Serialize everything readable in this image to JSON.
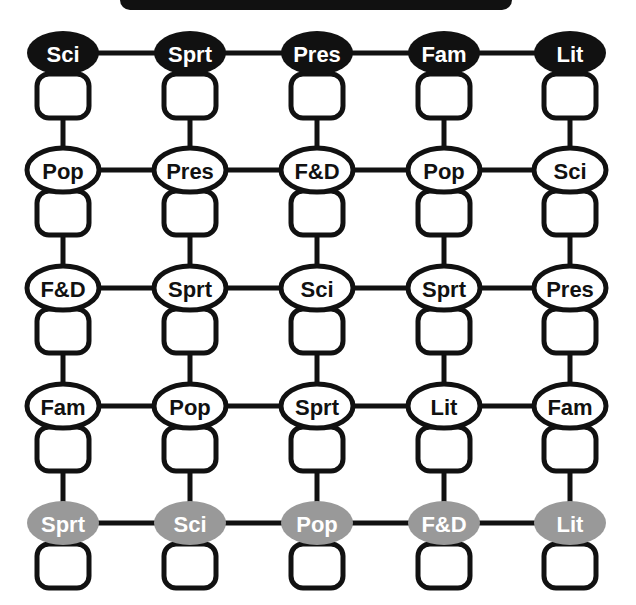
{
  "canvas": {
    "width": 636,
    "height": 605,
    "background": "#ffffff"
  },
  "title_banner": {
    "name": "title-banner",
    "visible_text": "",
    "note": "black rounded banner cropped at top edge of screenshot",
    "x": 120,
    "y": -22,
    "width": 392,
    "height": 32,
    "color": "#111111"
  },
  "style": {
    "black_fill": "#111111",
    "gray_fill": "#999999",
    "white_fill": "#ffffff",
    "outline": "#111111",
    "white_text": "#ffffff",
    "black_text": "#111111",
    "line_width": 5,
    "oval_rx": 36,
    "oval_ry": 22,
    "box_width": 52,
    "box_height": 44,
    "box_radius": 12,
    "label_font_size": 22
  },
  "layout": {
    "column_x": [
      63,
      190,
      317,
      444,
      570
    ],
    "row_oval_cy": [
      53,
      170,
      288,
      406,
      523
    ],
    "row_box_top": [
      74,
      191,
      309,
      427,
      544
    ]
  },
  "grid": {
    "rows": 5,
    "cols": 5,
    "row_styles": [
      "black",
      "white",
      "white",
      "white",
      "gray"
    ],
    "nodes": [
      [
        {
          "label": "Sci",
          "style": "black"
        },
        {
          "label": "Sprt",
          "style": "black"
        },
        {
          "label": "Pres",
          "style": "black"
        },
        {
          "label": "Fam",
          "style": "black"
        },
        {
          "label": "Lit",
          "style": "black"
        }
      ],
      [
        {
          "label": "Pop",
          "style": "white"
        },
        {
          "label": "Pres",
          "style": "white"
        },
        {
          "label": "F&D",
          "style": "white"
        },
        {
          "label": "Pop",
          "style": "white"
        },
        {
          "label": "Sci",
          "style": "white"
        }
      ],
      [
        {
          "label": "F&D",
          "style": "white"
        },
        {
          "label": "Sprt",
          "style": "white"
        },
        {
          "label": "Sci",
          "style": "white"
        },
        {
          "label": "Sprt",
          "style": "white"
        },
        {
          "label": "Pres",
          "style": "white"
        }
      ],
      [
        {
          "label": "Fam",
          "style": "white"
        },
        {
          "label": "Pop",
          "style": "white"
        },
        {
          "label": "Sprt",
          "style": "white"
        },
        {
          "label": "Lit",
          "style": "white"
        },
        {
          "label": "Fam",
          "style": "white"
        }
      ],
      [
        {
          "label": "Sprt",
          "style": "gray"
        },
        {
          "label": "Sci",
          "style": "gray"
        },
        {
          "label": "Pop",
          "style": "gray"
        },
        {
          "label": "F&D",
          "style": "gray"
        },
        {
          "label": "Lit",
          "style": "gray"
        }
      ]
    ]
  },
  "connectors": {
    "horizontal_note": "each row: ovals joined left-to-right by a thick line at the oval centre line",
    "vertical_note": "each column: the answer box under a node is joined by a thick vertical line down to the next row's oval; the last row's box has no line below it"
  },
  "legend_labels": {
    "Sci": "Science",
    "Sprt": "Sports",
    "Pres": "Presidents",
    "Fam": "Famous",
    "Lit": "Literature",
    "Pop": "Pop",
    "F&D": "Food & Drink"
  }
}
